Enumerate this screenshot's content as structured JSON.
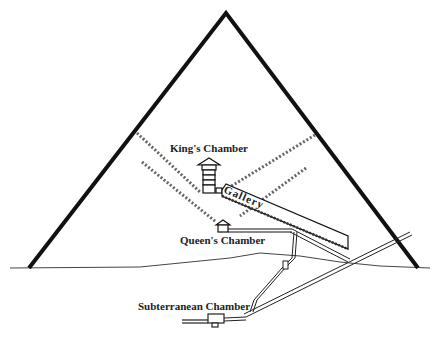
{
  "diagram": {
    "labels": {
      "kings_chamber": "King's Chamber",
      "gallery": "Gallery",
      "queens_chamber": "Queen's Chamber",
      "subterranean_chamber": "Subterranean Chamber"
    },
    "colors": {
      "outline": "#111111",
      "shaft_dash": "#555555",
      "background": "#ffffff"
    }
  }
}
